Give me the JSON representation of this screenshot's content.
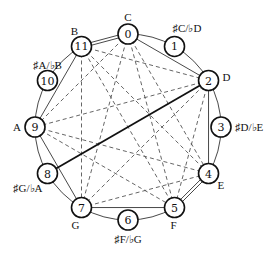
{
  "diagram": {
    "title": "",
    "center": [
      128,
      127
    ],
    "radius": 93,
    "node_radius": 10,
    "nodes": [
      {
        "id": 0,
        "num": "0",
        "label": "C",
        "white": true,
        "label_pos": "top"
      },
      {
        "id": 1,
        "num": "1",
        "label": "♯C/♭D",
        "white": false,
        "label_pos": "top"
      },
      {
        "id": 2,
        "num": "2",
        "label": "D",
        "white": true,
        "label_pos": "right"
      },
      {
        "id": 3,
        "num": "3",
        "label": "♯D/♭E",
        "white": false,
        "label_pos": "right"
      },
      {
        "id": 4,
        "num": "4",
        "label": "E",
        "white": true,
        "label_pos": "bottom-right"
      },
      {
        "id": 5,
        "num": "5",
        "label": "F",
        "white": true,
        "label_pos": "bottom-right"
      },
      {
        "id": 6,
        "num": "6",
        "label": "♯F/♭G",
        "white": false,
        "label_pos": "bottom"
      },
      {
        "id": 7,
        "num": "7",
        "label": "G",
        "white": true,
        "label_pos": "bottom-left"
      },
      {
        "id": 8,
        "num": "8",
        "label": "♯G/♭A",
        "white": false,
        "label_pos": "bottom-left"
      },
      {
        "id": 9,
        "num": "9",
        "label": "A",
        "white": true,
        "label_pos": "left"
      },
      {
        "id": 10,
        "num": "10",
        "label": "♯A/♭B",
        "white": false,
        "label_pos": "top-left"
      },
      {
        "id": 11,
        "num": "11",
        "label": "B",
        "white": true,
        "label_pos": "top"
      }
    ],
    "solid_edges": [
      [
        11,
        9
      ],
      [
        9,
        7
      ],
      [
        7,
        5
      ],
      [
        4,
        2
      ],
      [
        2,
        0
      ]
    ],
    "double_edges": [
      [
        0,
        11
      ],
      [
        5,
        4
      ]
    ],
    "arc_paths": [
      [
        0,
        1,
        2
      ],
      [
        2,
        3,
        4
      ],
      [
        5,
        6,
        7
      ],
      [
        7,
        8,
        9
      ],
      [
        9,
        10,
        11
      ]
    ],
    "thick_edges": [
      [
        2,
        8
      ]
    ],
    "dashed_edges": [
      [
        0,
        9
      ],
      [
        0,
        7
      ],
      [
        0,
        5
      ],
      [
        0,
        4
      ],
      [
        11,
        2
      ],
      [
        11,
        7
      ],
      [
        11,
        5
      ],
      [
        11,
        4
      ],
      [
        2,
        9
      ],
      [
        2,
        7
      ],
      [
        2,
        5
      ],
      [
        9,
        4
      ],
      [
        9,
        5
      ],
      [
        7,
        4
      ]
    ]
  }
}
